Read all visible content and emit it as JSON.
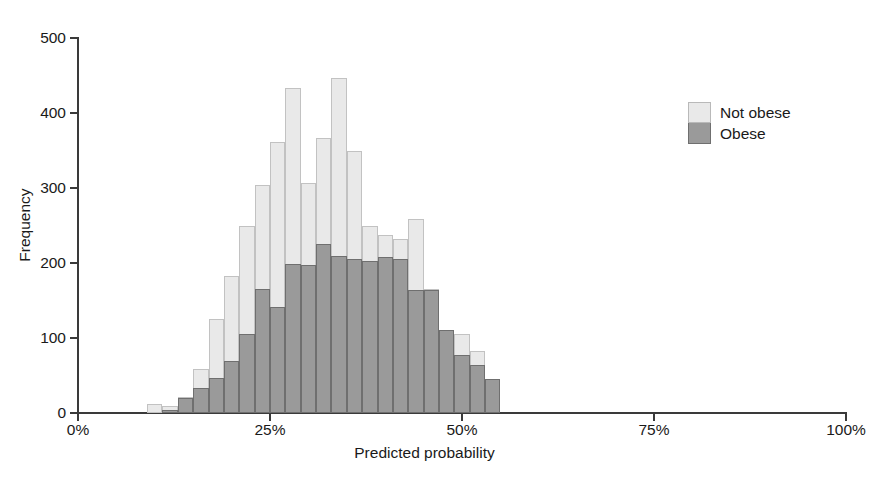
{
  "chart_data": {
    "type": "bar",
    "subtype": "overlaid-histogram",
    "title": "",
    "xlabel": "Predicted probability",
    "ylabel": "Frequency",
    "xlim": [
      0,
      100
    ],
    "ylim": [
      0,
      500
    ],
    "xtick_labels": [
      "0%",
      "25%",
      "50%",
      "75%",
      "100%"
    ],
    "xtick_values": [
      0,
      25,
      50,
      75,
      100
    ],
    "ytick_labels": [
      "0",
      "100",
      "200",
      "300",
      "400",
      "500"
    ],
    "ytick_values": [
      0,
      100,
      200,
      300,
      400,
      500
    ],
    "grid": false,
    "legend_position": "right",
    "bin_width": 2,
    "bin_starts": [
      9,
      11,
      13,
      15,
      17,
      19,
      21,
      23,
      25,
      27,
      29,
      31,
      33,
      35,
      37,
      39,
      41,
      43,
      45,
      47,
      49,
      51,
      53,
      55,
      57,
      59
    ],
    "series": [
      {
        "name": "Not obese",
        "color": "#e9e9e9",
        "edge_color": "#c2c2c2",
        "values": [
          12,
          10,
          22,
          59,
          125,
          183,
          249,
          304,
          361,
          433,
          307,
          367,
          447,
          349,
          249,
          238,
          232,
          259,
          165,
          111,
          105,
          83,
          46,
          0,
          0,
          0
        ]
      },
      {
        "name": "Obese",
        "color": "#9a9a9a",
        "edge_color": "#6f6f6f",
        "values": [
          0,
          4,
          20,
          33,
          47,
          70,
          105,
          165,
          142,
          199,
          197,
          225,
          210,
          205,
          203,
          208,
          205,
          164,
          164,
          111,
          78,
          64,
          46,
          0,
          0,
          0
        ]
      }
    ]
  },
  "legend": {
    "items": [
      {
        "label": "Not obese",
        "key": "notobese"
      },
      {
        "label": "Obese",
        "key": "obese"
      }
    ]
  }
}
